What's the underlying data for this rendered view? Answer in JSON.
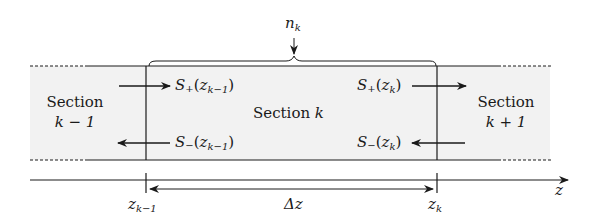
{
  "diagram": {
    "type": "waveguide-section-diagram",
    "colors": {
      "region_fill": "#f2f2f2",
      "line": "#1a1a1a"
    },
    "sections": {
      "left": {
        "line1": "Section",
        "line2": "k − 1"
      },
      "middle": {
        "label": "Section",
        "var": "k"
      },
      "right": {
        "line1": "Section",
        "line2": "k + 1"
      }
    },
    "index_label": {
      "var": "n",
      "sub": "k"
    },
    "signals": {
      "s_plus_left": {
        "base": "S",
        "sign": "+",
        "arg": "z",
        "sub": "k−1"
      },
      "s_minus_left": {
        "base": "S",
        "sign": "−",
        "arg": "z",
        "sub": "k−1"
      },
      "s_plus_right": {
        "base": "S",
        "sign": "+",
        "arg": "z",
        "sub": "k"
      },
      "s_minus_right": {
        "base": "S",
        "sign": "−",
        "arg": "z",
        "sub": "k"
      }
    },
    "axis": {
      "label": "z",
      "ticks": [
        {
          "var": "z",
          "sub": "k−1"
        },
        {
          "var": "z",
          "sub": "k"
        }
      ],
      "interval_label": "Δz"
    }
  }
}
